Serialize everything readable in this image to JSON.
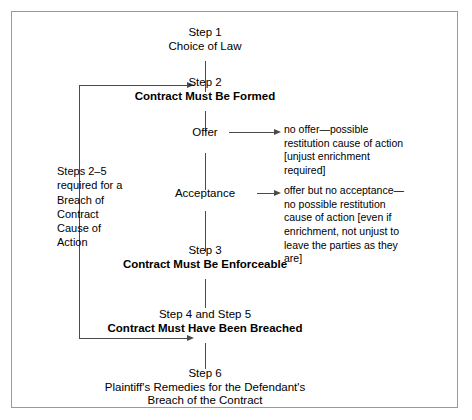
{
  "figure": {
    "type": "flowchart",
    "orientation": "vertical-spine",
    "border_color": "#9a9a9a",
    "line_color": "#4a4a4a",
    "text_color": "#000000"
  },
  "nodes": [
    {
      "id": "step1",
      "step": "Step 1",
      "title": "Choice of Law",
      "title_bold": false
    },
    {
      "id": "step2",
      "step": "Step 2",
      "title": "Contract Must Be Formed",
      "title_bold": true
    },
    {
      "id": "step3",
      "step": "Step 3",
      "title": "Contract Must Be Enforceable",
      "title_bold": true
    },
    {
      "id": "step45",
      "step": "Step 4 and Step 5",
      "title": "Contract Must Have Been Breached",
      "title_bold": true
    },
    {
      "id": "step6",
      "step": "Step 6",
      "title": "Plaintiff's Remedies for the Defendant's",
      "title2": "Breach of the Contract",
      "title_bold": false
    }
  ],
  "substeps": [
    {
      "id": "offer",
      "label": "Offer"
    },
    {
      "id": "acceptance",
      "label": "Acceptance"
    }
  ],
  "annotations": [
    {
      "id": "no-offer-annotation",
      "lines": [
        "no offer—possible",
        "restitution cause of action",
        "[unjust enrichment",
        "required]"
      ]
    },
    {
      "id": "no-acceptance-annotation",
      "lines": [
        "offer but no acceptance—",
        "no possible restitution",
        "cause of action [even if",
        "enrichment, not unjust to",
        "leave the parties as they",
        "are]"
      ]
    }
  ],
  "left_block": {
    "id": "steps-2-5-requirement",
    "lines": [
      "Steps 2–5",
      "required for a",
      "Breach of",
      "Contract",
      "Cause of",
      "Action"
    ]
  }
}
